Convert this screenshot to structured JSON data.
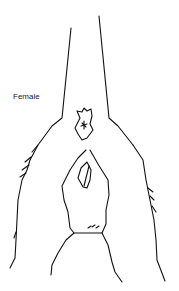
{
  "diagram": {
    "label": "Female"
  }
}
